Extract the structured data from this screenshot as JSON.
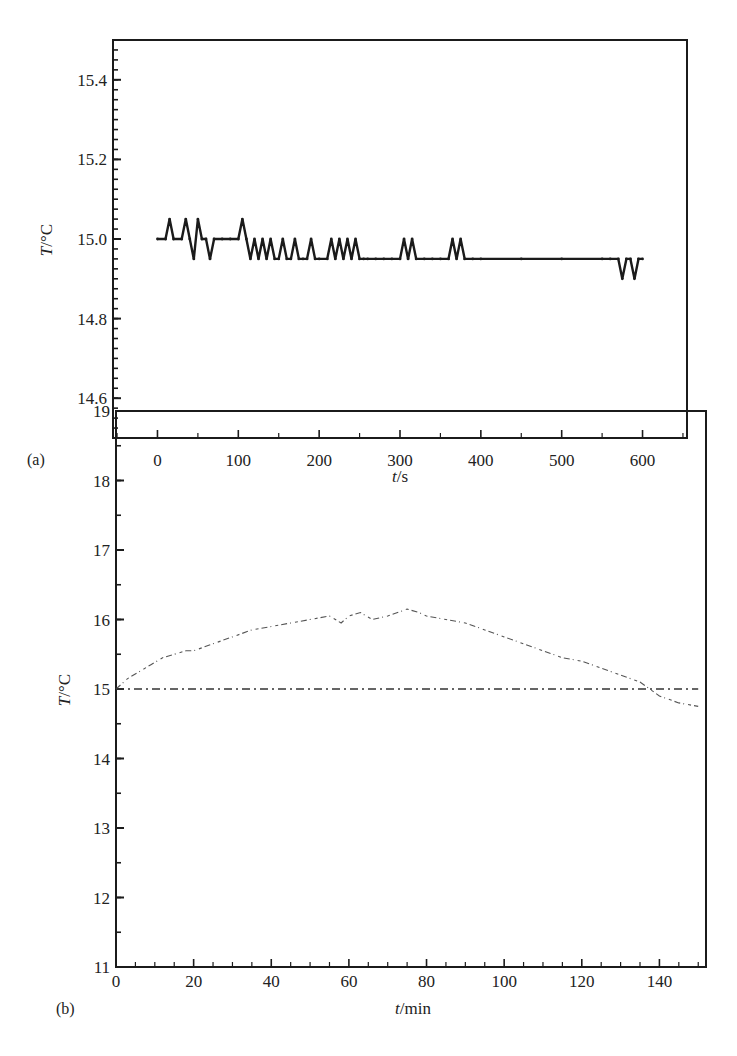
{
  "chart_data": [
    {
      "panel": "(a)",
      "type": "line",
      "title": "",
      "xlabel": "t/s",
      "ylabel": "T/°C",
      "xlim": [
        -55,
        655
      ],
      "ylim": [
        14.5,
        15.5
      ],
      "xticks": [
        0,
        100,
        200,
        300,
        400,
        500,
        600
      ],
      "xtick_labels": [
        "0",
        "100",
        "200",
        "300",
        "400",
        "500",
        "600"
      ],
      "yticks": [
        14.6,
        14.8,
        15.0,
        15.2,
        15.4
      ],
      "ytick_labels": [
        "14.6",
        "14.8",
        "15.0",
        "15.2",
        "15.4"
      ],
      "grid": false,
      "legend": null,
      "series": [
        {
          "name": "T",
          "style": "dotted-markers",
          "x": [
            0,
            10,
            15,
            20,
            30,
            35,
            40,
            45,
            50,
            55,
            60,
            65,
            70,
            80,
            90,
            100,
            105,
            110,
            115,
            120,
            125,
            130,
            135,
            140,
            145,
            150,
            155,
            160,
            165,
            170,
            175,
            180,
            185,
            190,
            195,
            200,
            210,
            215,
            220,
            225,
            230,
            235,
            240,
            245,
            250,
            255,
            260,
            270,
            280,
            290,
            300,
            305,
            310,
            315,
            320,
            330,
            340,
            350,
            360,
            365,
            370,
            375,
            380,
            390,
            400,
            450,
            500,
            550,
            560,
            570,
            575,
            580,
            585,
            590,
            595,
            600
          ],
          "values": [
            15.0,
            15.0,
            15.05,
            15.0,
            15.0,
            15.05,
            15.0,
            14.95,
            15.05,
            15.0,
            15.0,
            14.95,
            15.0,
            15.0,
            15.0,
            15.0,
            15.05,
            15.0,
            14.95,
            15.0,
            14.95,
            15.0,
            14.95,
            15.0,
            14.95,
            14.95,
            15.0,
            14.95,
            14.95,
            15.0,
            14.95,
            14.95,
            14.95,
            15.0,
            14.95,
            14.95,
            14.95,
            15.0,
            14.95,
            15.0,
            14.95,
            15.0,
            14.95,
            15.0,
            14.95,
            14.95,
            14.95,
            14.95,
            14.95,
            14.95,
            14.95,
            15.0,
            14.95,
            15.0,
            14.95,
            14.95,
            14.95,
            14.95,
            14.95,
            15.0,
            14.95,
            15.0,
            14.95,
            14.95,
            14.95,
            14.95,
            14.95,
            14.95,
            14.95,
            14.95,
            14.9,
            14.95,
            14.95,
            14.9,
            14.95,
            14.95
          ]
        }
      ]
    },
    {
      "panel": "(b)",
      "type": "line",
      "title": "",
      "xlabel": "t/min",
      "ylabel": "T/°C",
      "xlim": [
        0,
        152
      ],
      "ylim": [
        11,
        19
      ],
      "xticks": [
        0,
        20,
        40,
        60,
        80,
        100,
        120,
        140
      ],
      "xtick_labels": [
        "0",
        "20",
        "40",
        "60",
        "80",
        "100",
        "120",
        "140"
      ],
      "yticks": [
        11,
        12,
        13,
        14,
        15,
        16,
        17,
        18,
        19
      ],
      "ytick_labels": [
        "11",
        "12",
        "13",
        "14",
        "15",
        "16",
        "17",
        "18",
        "19"
      ],
      "grid": false,
      "legend": null,
      "series": [
        {
          "name": "Measured T",
          "style": "dotted-irregular",
          "x": [
            0,
            3,
            6,
            9,
            12,
            15,
            18,
            20,
            25,
            30,
            35,
            40,
            45,
            50,
            55,
            58,
            60,
            63,
            66,
            70,
            75,
            78,
            80,
            85,
            90,
            95,
            100,
            105,
            110,
            115,
            120,
            125,
            130,
            135,
            140,
            145,
            150
          ],
          "values": [
            15.0,
            15.15,
            15.25,
            15.35,
            15.45,
            15.5,
            15.55,
            15.55,
            15.65,
            15.75,
            15.85,
            15.9,
            15.95,
            16.0,
            16.05,
            15.95,
            16.05,
            16.1,
            16.0,
            16.05,
            16.15,
            16.1,
            16.05,
            16.0,
            15.95,
            15.85,
            15.75,
            15.65,
            15.55,
            15.45,
            15.4,
            15.3,
            15.2,
            15.1,
            14.9,
            14.8,
            14.75
          ]
        },
        {
          "name": "Reference 15 °C",
          "style": "dash-dot",
          "x": [
            0,
            150
          ],
          "values": [
            15.0,
            15.0
          ]
        }
      ]
    }
  ],
  "panels": {
    "a": {
      "label": "(a)",
      "xlabel_italic": "t",
      "xlabel_unit": "/s",
      "ylabel_italic": "T",
      "ylabel_unit": "/°C"
    },
    "b": {
      "label": "(b)",
      "xlabel_italic": "t",
      "xlabel_unit": "/min",
      "ylabel_italic": "T",
      "ylabel_unit": "/°C"
    }
  },
  "colors": {
    "ink": "#1b1b1b",
    "background": "#ffffff",
    "faint_curve": "#555555"
  }
}
